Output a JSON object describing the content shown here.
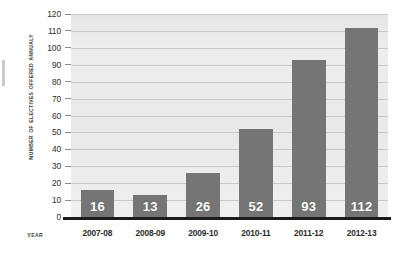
{
  "chart_data": {
    "type": "bar",
    "title": "",
    "xlabel": "Year",
    "ylabel": "Number of Electives Offered Annualy",
    "categories": [
      "2007-08",
      "2008-09",
      "2009-10",
      "2010-11",
      "2011-12",
      "2012-13"
    ],
    "values": [
      16,
      13,
      26,
      52,
      93,
      112
    ],
    "value_labels": [
      "16",
      "13",
      "26",
      "52",
      "93",
      "112"
    ],
    "ylim": [
      0,
      120
    ],
    "ytick_step": 10,
    "yticks": [
      120,
      110,
      100,
      90,
      80,
      70,
      60,
      50,
      40,
      30,
      20,
      10,
      0
    ],
    "ytick_labels": [
      "120",
      "110",
      "100",
      "90",
      "80",
      "70",
      "60",
      "50",
      "40",
      "30",
      "20",
      "10",
      "0"
    ],
    "grid": true,
    "grid_axis": "y",
    "legend": false,
    "legend_position": "none",
    "series": [
      {
        "name": "Number of Electives Offered Annualy",
        "values": [
          16,
          13,
          26,
          52,
          93,
          112
        ]
      }
    ],
    "annotations": [
      {
        "category": "2007-08",
        "text": "16",
        "position": "inside-bottom"
      },
      {
        "category": "2008-09",
        "text": "13",
        "position": "inside-bottom"
      },
      {
        "category": "2009-10",
        "text": "26",
        "position": "inside-bottom"
      },
      {
        "category": "2010-11",
        "text": "52",
        "position": "inside-bottom"
      },
      {
        "category": "2011-12",
        "text": "93",
        "position": "inside-bottom"
      },
      {
        "category": "2012-13",
        "text": "112",
        "position": "inside-bottom"
      }
    ],
    "colors": {
      "bar_fill": "#757575",
      "plot_background": "#ececec",
      "gridline": "#c9c9c9",
      "axis_line": "#1c1c1c",
      "value_label": "#ffffff",
      "tick_label": "#2e2e2e",
      "axis_title": "#3b3b3b"
    }
  }
}
